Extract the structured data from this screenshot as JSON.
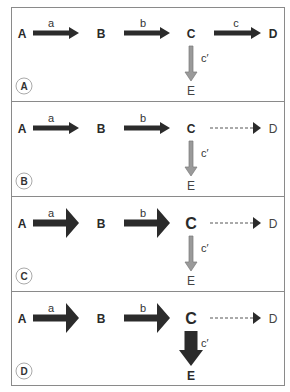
{
  "figure": {
    "panels": [
      {
        "badge": "A",
        "nodes": {
          "A": "A",
          "B": "B",
          "C": "C",
          "D": "D",
          "E": "E"
        },
        "edges": {
          "a": "a",
          "b": "b",
          "c": "c",
          "c_prime": "c′"
        },
        "style": {
          "a": "medium",
          "b": "medium",
          "c": "medium",
          "c_prime": "thin-gray",
          "C_size": "normal",
          "D_weight": "bold",
          "E_weight": "normal"
        }
      },
      {
        "badge": "B",
        "nodes": {
          "A": "A",
          "B": "B",
          "C": "C",
          "D": "D",
          "E": "E"
        },
        "edges": {
          "a": "a",
          "b": "b",
          "c": "",
          "c_prime": "c′"
        },
        "style": {
          "a": "medium",
          "b": "medium",
          "c": "dashed",
          "c_prime": "thin-gray",
          "C_size": "normal",
          "D_weight": "normal",
          "E_weight": "normal"
        }
      },
      {
        "badge": "C",
        "nodes": {
          "A": "A",
          "B": "B",
          "C": "C",
          "D": "D",
          "E": "E"
        },
        "edges": {
          "a": "a",
          "b": "b",
          "c": "",
          "c_prime": "c′"
        },
        "style": {
          "a": "thick",
          "b": "thick",
          "c": "dashed",
          "c_prime": "thin-gray",
          "C_size": "large",
          "D_weight": "normal",
          "E_weight": "normal"
        }
      },
      {
        "badge": "D",
        "nodes": {
          "A": "A",
          "B": "B",
          "C": "C",
          "D": "D",
          "E": "E"
        },
        "edges": {
          "a": "a",
          "b": "b",
          "c": "",
          "c_prime": "c′"
        },
        "style": {
          "a": "thick",
          "b": "thick",
          "c": "dashed",
          "c_prime": "thick-dark",
          "C_size": "large",
          "D_weight": "normal",
          "E_weight": "bold"
        }
      }
    ],
    "colors": {
      "arrow_dark": "#2b2b2b",
      "arrow_gray": "#9a9a9a",
      "dashed": "#555555",
      "border": "#8a8a8a"
    }
  }
}
